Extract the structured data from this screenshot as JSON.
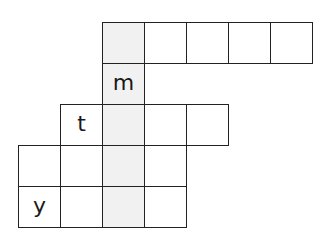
{
  "puzzle": {
    "type": "crossword-grid",
    "colors": {
      "line": "#222222",
      "cell_fill": "#ffffff",
      "shaded_fill": "#f1f1f1",
      "letter": "#1a1a1a"
    },
    "grid_origin": {
      "x": 18,
      "y": 22
    },
    "cell_size": {
      "w": 42,
      "h": 41
    },
    "shaded_column": 2,
    "rows": [
      {
        "row": 0,
        "cells": [
          {
            "col": 2,
            "letter": "",
            "shaded": true
          },
          {
            "col": 3,
            "letter": "",
            "shaded": false
          },
          {
            "col": 4,
            "letter": "",
            "shaded": false
          },
          {
            "col": 5,
            "letter": "",
            "shaded": false
          },
          {
            "col": 6,
            "letter": "",
            "shaded": false
          }
        ]
      },
      {
        "row": 1,
        "cells": [
          {
            "col": 2,
            "letter": "m",
            "shaded": true
          }
        ]
      },
      {
        "row": 2,
        "cells": [
          {
            "col": 1,
            "letter": "t",
            "shaded": false
          },
          {
            "col": 2,
            "letter": "",
            "shaded": true
          },
          {
            "col": 3,
            "letter": "",
            "shaded": false
          },
          {
            "col": 4,
            "letter": "",
            "shaded": false
          }
        ]
      },
      {
        "row": 3,
        "cells": [
          {
            "col": 0,
            "letter": "",
            "shaded": false
          },
          {
            "col": 1,
            "letter": "",
            "shaded": false
          },
          {
            "col": 2,
            "letter": "",
            "shaded": true
          },
          {
            "col": 3,
            "letter": "",
            "shaded": false
          }
        ]
      },
      {
        "row": 4,
        "cells": [
          {
            "col": 0,
            "letter": "y",
            "shaded": false
          },
          {
            "col": 1,
            "letter": "",
            "shaded": false
          },
          {
            "col": 2,
            "letter": "",
            "shaded": true
          },
          {
            "col": 3,
            "letter": "",
            "shaded": false
          }
        ]
      }
    ]
  }
}
